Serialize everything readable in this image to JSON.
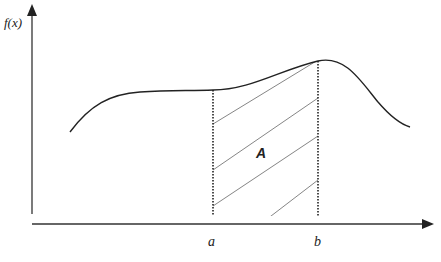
{
  "diagram": {
    "title": "",
    "y_axis_label": "f(x)",
    "x_marks": [
      {
        "label": "a"
      },
      {
        "label": "b"
      }
    ],
    "region_label": "A",
    "colors": {
      "curve": "#222222",
      "axis": "#333333",
      "hatch": "#777777"
    }
  }
}
